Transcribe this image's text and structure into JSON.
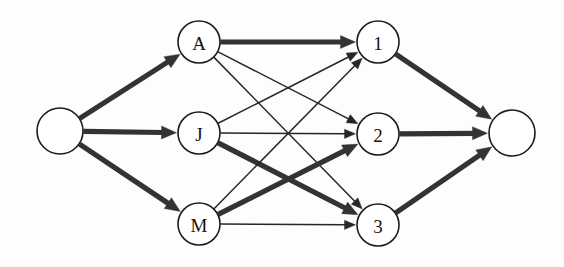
{
  "diagram": {
    "background_color": "#fdfdfd",
    "edge_color_thin": "#262626",
    "edge_color_thick": "#333333",
    "node_fill": "#ffffff",
    "node_stroke": "#1c1c1c",
    "nodes": [
      {
        "id": "source",
        "label": "",
        "cx": 60,
        "cy": 131,
        "r": 23,
        "column": "source"
      },
      {
        "id": "A",
        "label": "A",
        "cx": 199,
        "cy": 42,
        "r": 21,
        "column": "left"
      },
      {
        "id": "J",
        "label": "J",
        "cx": 199,
        "cy": 133,
        "r": 21,
        "column": "left"
      },
      {
        "id": "M",
        "label": "M",
        "cx": 199,
        "cy": 224,
        "r": 21,
        "column": "left"
      },
      {
        "id": "1",
        "label": "1",
        "cx": 378,
        "cy": 42,
        "r": 21,
        "column": "right"
      },
      {
        "id": "2",
        "label": "2",
        "cx": 378,
        "cy": 134,
        "r": 21,
        "column": "right"
      },
      {
        "id": "3",
        "label": "3",
        "cx": 378,
        "cy": 225,
        "r": 21,
        "column": "right"
      },
      {
        "id": "sink",
        "label": "",
        "cx": 512,
        "cy": 133,
        "r": 23,
        "column": "sink"
      }
    ],
    "edges": [
      {
        "id": "source-A",
        "from": "source",
        "to": "A",
        "weight": "thick"
      },
      {
        "id": "source-J",
        "from": "source",
        "to": "J",
        "weight": "thick"
      },
      {
        "id": "source-M",
        "from": "source",
        "to": "M",
        "weight": "thick"
      },
      {
        "id": "A-1",
        "from": "A",
        "to": "1",
        "weight": "thick"
      },
      {
        "id": "A-2",
        "from": "A",
        "to": "2",
        "weight": "thin"
      },
      {
        "id": "A-3",
        "from": "A",
        "to": "3",
        "weight": "thin"
      },
      {
        "id": "J-1",
        "from": "J",
        "to": "1",
        "weight": "thin"
      },
      {
        "id": "J-2",
        "from": "J",
        "to": "2",
        "weight": "thin"
      },
      {
        "id": "J-3",
        "from": "J",
        "to": "3",
        "weight": "thick"
      },
      {
        "id": "M-1",
        "from": "M",
        "to": "1",
        "weight": "thin"
      },
      {
        "id": "M-2",
        "from": "M",
        "to": "2",
        "weight": "thick"
      },
      {
        "id": "M-3",
        "from": "M",
        "to": "3",
        "weight": "thin"
      },
      {
        "id": "1-sink",
        "from": "1",
        "to": "sink",
        "weight": "thick"
      },
      {
        "id": "2-sink",
        "from": "2",
        "to": "sink",
        "weight": "thick"
      },
      {
        "id": "3-sink",
        "from": "3",
        "to": "sink",
        "weight": "thick"
      }
    ]
  }
}
